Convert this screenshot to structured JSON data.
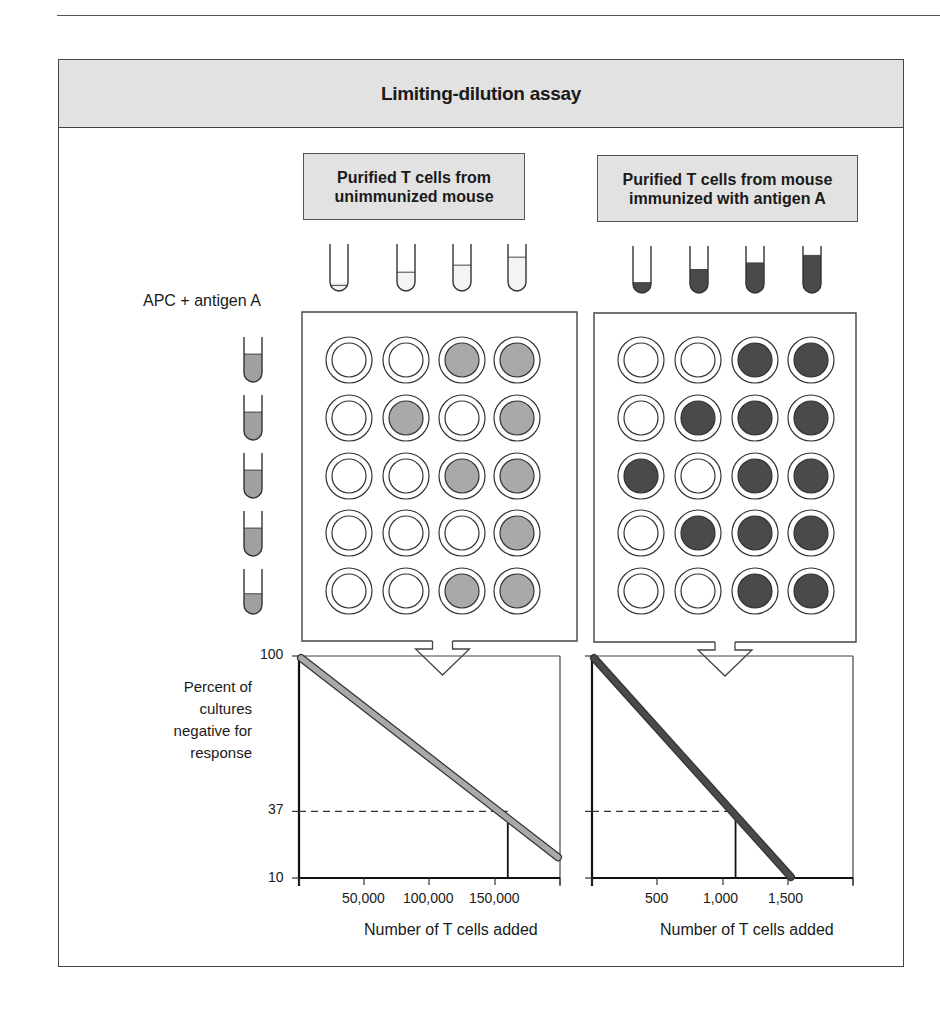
{
  "title": "Limiting-dilution assay",
  "left_panel": {
    "header": [
      "Purified T cells from",
      "unimmunized mouse"
    ],
    "tube_fill_levels": [
      0.12,
      0.4,
      0.55,
      0.72
    ],
    "tube_color": "#f4f4f4",
    "plate_wells": [
      [
        0,
        0,
        1,
        1
      ],
      [
        0,
        1,
        0,
        1
      ],
      [
        0,
        0,
        1,
        1
      ],
      [
        0,
        0,
        0,
        1
      ],
      [
        0,
        0,
        1,
        1
      ]
    ],
    "well_positive_color": "#a9a9a9"
  },
  "right_panel": {
    "header": [
      "Purified T cells from mouse",
      "immunized with antigen A"
    ],
    "tube_fill_levels": [
      0.22,
      0.5,
      0.64,
      0.8
    ],
    "tube_color": "#4a4a4a",
    "plate_wells": [
      [
        0,
        0,
        1,
        1
      ],
      [
        0,
        1,
        1,
        1
      ],
      [
        1,
        0,
        1,
        1
      ],
      [
        0,
        1,
        1,
        1
      ],
      [
        0,
        0,
        1,
        1
      ]
    ],
    "well_positive_color": "#4a4a4a"
  },
  "apc_label": "APC + antigen A",
  "apc_tube_fill_levels": [
    0.62,
    0.62,
    0.62,
    0.62,
    0.45
  ],
  "apc_tube_color": "#a0a0a0",
  "y_axis_label": [
    "Percent of",
    "cultures",
    "negative for",
    "response"
  ],
  "chart_data": [
    {
      "type": "line",
      "title": "Purified T cells from unimmunized mouse",
      "xlabel": "Number of T cells added",
      "ylabel": "Percent of cultures negative for response",
      "x_ticks": [
        "50,000",
        "100,000",
        "150,000"
      ],
      "y_ticks": [
        "100",
        "37",
        "10"
      ],
      "xlim": [
        0,
        200000
      ],
      "ylim": [
        10,
        100
      ],
      "series": [
        {
          "name": "unimmunized",
          "x": [
            0,
            200000
          ],
          "y": [
            100,
            18
          ],
          "color": "#a9a9a9"
        }
      ],
      "annotations": {
        "y_37_intercept_x": 160000
      },
      "grid": false
    },
    {
      "type": "line",
      "title": "Purified T cells from mouse immunized with antigen A",
      "xlabel": "Number of T cells added",
      "ylabel": "Percent of cultures negative for response",
      "x_ticks": [
        "500",
        "1,000",
        "1,500"
      ],
      "y_ticks": [
        "100",
        "37",
        "10"
      ],
      "xlim": [
        0,
        2000
      ],
      "ylim": [
        10,
        100
      ],
      "series": [
        {
          "name": "immunized",
          "x": [
            0,
            1540
          ],
          "y": [
            100,
            10
          ],
          "color": "#4a4a4a"
        }
      ],
      "annotations": {
        "y_37_intercept_x": 1100
      },
      "grid": false
    }
  ]
}
